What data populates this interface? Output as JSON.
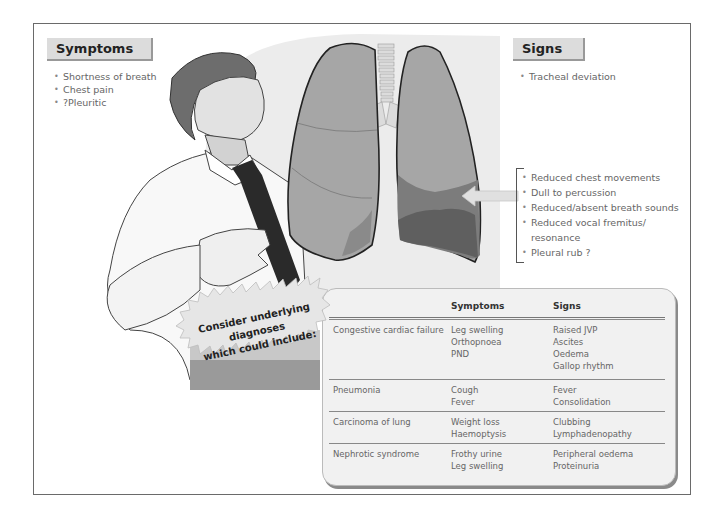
{
  "symptoms": {
    "title": "Symptoms",
    "items": [
      "Shortness of breath",
      "Chest pain",
      "?Pleuritic"
    ]
  },
  "signs": {
    "title": "Signs",
    "items": [
      "Tracheal deviation"
    ],
    "lung_signs": [
      "Reduced chest movements",
      "Dull to percussion",
      "Reduced/absent breath sounds",
      "Reduced vocal fremitus/ resonance",
      "Pleural rub ?"
    ]
  },
  "callout": {
    "line1": "Consider underlying diagnoses",
    "line2": "which could include:"
  },
  "table": {
    "headers": [
      "",
      "Symptoms",
      "Signs"
    ],
    "rows": [
      {
        "diagnosis": "Congestive cardiac failure",
        "symptoms": [
          "Leg swelling",
          "Orthopnoea",
          "PND"
        ],
        "signs": [
          "Raised JVP",
          "Ascites",
          "Oedema",
          "Gallop rhythm"
        ]
      },
      {
        "diagnosis": "Pneumonia",
        "symptoms": [
          "Cough",
          "Fever"
        ],
        "signs": [
          "Fever",
          "Consolidation"
        ]
      },
      {
        "diagnosis": "Carcinoma of lung",
        "symptoms": [
          "Weight loss",
          "Haemoptysis"
        ],
        "signs": [
          "Clubbing",
          "Lymphadenopathy"
        ]
      },
      {
        "diagnosis": "Nephrotic syndrome",
        "symptoms": [
          "Frothy urine",
          "Leg swelling"
        ],
        "signs": [
          "Peripheral oedema",
          "Proteinuria"
        ]
      }
    ]
  },
  "illustration": {
    "figure": "man-clutching-chest",
    "organ": "lungs-with-right-lower-effusion",
    "arrow": "left-arrow"
  }
}
